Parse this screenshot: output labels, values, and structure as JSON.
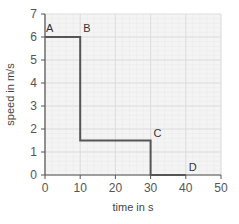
{
  "chart_data": {
    "type": "line",
    "title": "",
    "xlabel": "time in s",
    "ylabel": "speed in m/s",
    "xlim": [
      0,
      50
    ],
    "ylim": [
      0,
      7
    ],
    "grid": true,
    "x_ticks": [
      "0",
      "10",
      "20",
      "30",
      "40",
      "50"
    ],
    "y_ticks": [
      "0",
      "1",
      "2",
      "3",
      "4",
      "5",
      "6",
      "7"
    ],
    "series": [
      {
        "name": "speed",
        "points": [
          [
            0,
            6
          ],
          [
            10,
            6
          ],
          [
            10,
            1.5
          ],
          [
            30,
            1.5
          ],
          [
            30,
            0
          ],
          [
            40,
            0
          ]
        ]
      }
    ],
    "annotations": [
      {
        "label": "A",
        "x": 0,
        "y": 6
      },
      {
        "label": "B",
        "x": 10,
        "y": 6
      },
      {
        "label": "C",
        "x": 30,
        "y": 1.5
      },
      {
        "label": "D",
        "x": 40,
        "y": 0
      }
    ],
    "line_color": "#555555",
    "grid_color": "#dddddd"
  }
}
